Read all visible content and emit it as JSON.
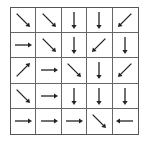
{
  "grid": {
    "rows": 5,
    "cols": 5,
    "line_color": "#555555",
    "arrow_color": "#222222",
    "cells": [
      [
        "down-right",
        "down-right",
        "down",
        "down",
        "down-left"
      ],
      [
        "right",
        "down-right",
        "down",
        "down-left",
        "down"
      ],
      [
        "up-right",
        "right",
        "down-right",
        "down",
        "down-left"
      ],
      [
        "down-right",
        "right",
        "down",
        "down",
        "down"
      ],
      [
        "right",
        "right",
        "right",
        "down-right",
        "left"
      ]
    ]
  }
}
